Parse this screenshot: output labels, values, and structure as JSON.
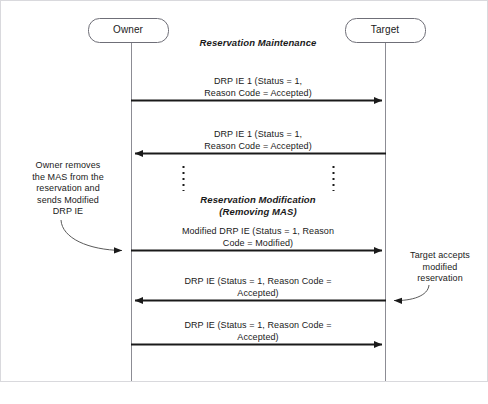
{
  "diagram": {
    "title": "Reservation Maintenance",
    "actors": [
      {
        "id": "owner",
        "label": "Owner"
      },
      {
        "id": "target",
        "label": "Target"
      }
    ],
    "phases": [
      {
        "id": "phase-maintenance",
        "label": "Reservation Maintenance"
      },
      {
        "id": "phase-modification",
        "label": "Reservation Modification\n(Removing MAS)"
      }
    ],
    "messages": [
      {
        "id": "msg-1",
        "label": "DRP IE 1 (Status = 1,\nReason Code = Accepted)",
        "from": "owner",
        "to": "target",
        "direction": "right"
      },
      {
        "id": "msg-2",
        "label": "DRP IE 1 (Status = 1,\nReason Code = Accepted)",
        "from": "target",
        "to": "owner",
        "direction": "left"
      },
      {
        "id": "msg-3",
        "label": "Modified DRP IE (Status = 1, Reason\nCode = Modified)",
        "from": "owner",
        "to": "target",
        "direction": "right"
      },
      {
        "id": "msg-4",
        "label": "DRP IE (Status = 1, Reason Code =\nAccepted)",
        "from": "target",
        "to": "owner",
        "direction": "left"
      },
      {
        "id": "msg-5",
        "label": "DRP IE (Status = 1, Reason Code =\nAccepted)",
        "from": "owner",
        "to": "target",
        "direction": "right"
      }
    ],
    "notes": [
      {
        "id": "note-owner-removes-mas",
        "label": "Owner removes\nthe MAS from the\nreservation and\nsends Modified\nDRP IE",
        "anchor": "owner"
      },
      {
        "id": "note-target-accepts",
        "label": "Target accepts\nmodified\nreservation",
        "anchor": "target"
      }
    ],
    "continuation": {
      "id": "continuation-ellipsis",
      "style": "vertical-dotted"
    },
    "colors": {
      "line": "#1a1a1a",
      "lifeline": "#8c8c94",
      "actor_border": "#6f6f78",
      "frame": "#d9d9dd",
      "text": "#1a1a1a",
      "background": "#ffffff"
    }
  }
}
